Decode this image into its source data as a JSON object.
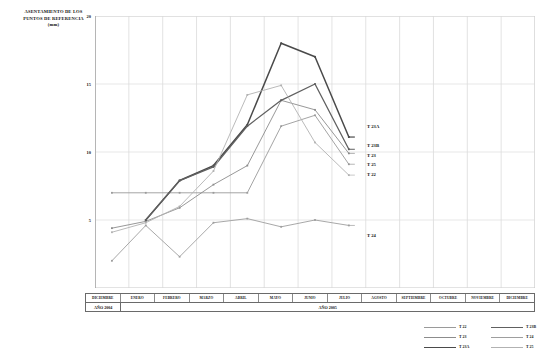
{
  "title": "ASENTAMIENTO DE LOS PUNTOS DE REFERENCIA (mm)",
  "title_lines": {
    "l1": "ASENTAMIENTO DE LOS",
    "l2": "PUNTOS DE REFERENCIA",
    "l3": "(mm)"
  },
  "axis_table": {
    "months": [
      "DICIEMBRE",
      "ENERO",
      "FEBRERO",
      "MARZO",
      "ABRIL",
      "MAYO",
      "JUNIO",
      "JULIO",
      "AGOSTO",
      "SEPTIEMBRE",
      "OCTUBRE",
      "NOVIEMBRE",
      "DICIEMBRE"
    ],
    "years": [
      {
        "label": "AÑO 2004",
        "span": 1
      },
      {
        "label": "AÑO 2005",
        "span": 12
      }
    ]
  },
  "legend": {
    "entries": [
      {
        "label": "T 22",
        "color": "#9a9a9a",
        "width": 0.9
      },
      {
        "label": "T 23",
        "color": "#8c8c8c",
        "width": 0.9
      },
      {
        "label": "T 23A",
        "color": "#4a4a4a",
        "width": 1.5
      },
      {
        "label": "T 23B",
        "color": "#606060",
        "width": 1.3
      },
      {
        "label": "T 24",
        "color": "#9e9e9e",
        "width": 0.9
      },
      {
        "label": "T 25",
        "color": "#b2b2b2",
        "width": 0.9
      }
    ]
  },
  "series_end_labels": [
    {
      "name": "T 23A",
      "x": 367,
      "y": 124
    },
    {
      "name": "T 23B",
      "x": 367,
      "y": 143
    },
    {
      "name": "T 23",
      "x": 367,
      "y": 153
    },
    {
      "name": "T 25",
      "x": 367,
      "y": 162
    },
    {
      "name": "T 22",
      "x": 367,
      "y": 172
    },
    {
      "name": "T 24",
      "x": 367,
      "y": 233
    }
  ],
  "chart_data": {
    "type": "line",
    "title": "ASENTAMIENTO DE LOS PUNTOS DE REFERENCIA (mm)",
    "xlabel": "",
    "ylabel": "mm",
    "ylim": [
      0,
      20
    ],
    "yticks": [
      5,
      10,
      15,
      20
    ],
    "grid": true,
    "legend_position": "bottom-right",
    "categories": [
      "DICIEMBRE",
      "ENERO",
      "FEBRERO",
      "MARZO",
      "ABRIL",
      "MAYO",
      "JUNIO",
      "JULIO",
      "AGOSTO",
      "SEPTIEMBRE",
      "OCTUBRE",
      "NOVIEMBRE",
      "DICIEMBRE"
    ],
    "series": [
      {
        "name": "T 22",
        "color": "#9a9a9a",
        "width": 0.9,
        "values": [
          7.0,
          7.0,
          7.0,
          7.0,
          7.0,
          11.9,
          12.7,
          9.1,
          null,
          null,
          null,
          null,
          null
        ]
      },
      {
        "name": "T 23",
        "color": "#8c8c8c",
        "width": 0.9,
        "values": [
          4.4,
          4.9,
          5.9,
          7.6,
          9.0,
          13.8,
          13.1,
          9.9,
          null,
          null,
          null,
          null,
          null
        ]
      },
      {
        "name": "T 23A",
        "color": "#4a4a4a",
        "width": 1.5,
        "values": [
          null,
          5.0,
          7.9,
          9.0,
          12.0,
          18.0,
          17.0,
          11.1,
          null,
          null,
          null,
          null,
          null
        ]
      },
      {
        "name": "T 23B",
        "color": "#606060",
        "width": 1.3,
        "values": [
          null,
          5.0,
          7.9,
          8.9,
          11.9,
          13.8,
          15.0,
          10.2,
          null,
          null,
          null,
          null,
          null
        ]
      },
      {
        "name": "T 24",
        "color": "#9e9e9e",
        "width": 0.9,
        "values": [
          2.0,
          4.6,
          2.3,
          4.8,
          5.1,
          4.5,
          5.0,
          4.6,
          null,
          null,
          null,
          null,
          null
        ]
      },
      {
        "name": "T 25",
        "color": "#b2b2b2",
        "width": 0.9,
        "values": [
          4.1,
          4.8,
          6.0,
          8.6,
          14.2,
          14.9,
          10.7,
          8.3,
          null,
          null,
          null,
          null,
          null
        ]
      }
    ]
  }
}
